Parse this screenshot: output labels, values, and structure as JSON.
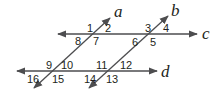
{
  "diagram": {
    "type": "parallel-lines-transversals",
    "colors": {
      "line": "#4d4d4f",
      "text": "#231f20",
      "background": "#ffffff"
    },
    "lines": [
      {
        "name": "a",
        "label": "a"
      },
      {
        "name": "b",
        "label": "b"
      },
      {
        "name": "c",
        "label": "c"
      },
      {
        "name": "d",
        "label": "d"
      }
    ],
    "angles": [
      "1",
      "2",
      "3",
      "4",
      "5",
      "6",
      "7",
      "8",
      "9",
      "10",
      "11",
      "12",
      "13",
      "14",
      "15",
      "16"
    ]
  }
}
